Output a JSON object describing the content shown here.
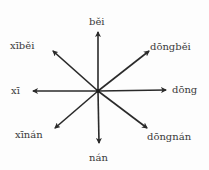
{
  "diagram": {
    "title": "",
    "center": {
      "x": 98,
      "y": 91
    },
    "directions": [
      {
        "key": "north",
        "label": "běi",
        "tip": {
          "x": 98,
          "y": 32
        },
        "label_pos": {
          "x": 89,
          "y": 17
        }
      },
      {
        "key": "northwest",
        "label": "xīběi",
        "tip": {
          "x": 53,
          "y": 51
        },
        "label_pos": {
          "x": 10,
          "y": 41
        }
      },
      {
        "key": "northeast",
        "label": "dōngběi",
        "tip": {
          "x": 149,
          "y": 51
        },
        "label_pos": {
          "x": 150,
          "y": 42
        }
      },
      {
        "key": "west",
        "label": "xī",
        "tip": {
          "x": 33,
          "y": 91
        },
        "label_pos": {
          "x": 11,
          "y": 86
        }
      },
      {
        "key": "east",
        "label": "dōng",
        "tip": {
          "x": 166,
          "y": 90
        },
        "label_pos": {
          "x": 172,
          "y": 85
        }
      },
      {
        "key": "southwest",
        "label": "xīnán",
        "tip": {
          "x": 55,
          "y": 128
        },
        "label_pos": {
          "x": 15,
          "y": 130
        }
      },
      {
        "key": "southeast",
        "label": "dōngnán",
        "tip": {
          "x": 147,
          "y": 128
        },
        "label_pos": {
          "x": 147,
          "y": 132
        }
      },
      {
        "key": "south",
        "label": "nán",
        "tip": {
          "x": 99,
          "y": 143
        },
        "label_pos": {
          "x": 89,
          "y": 153
        }
      }
    ],
    "colors": {
      "arrow": "#2a2a2a",
      "text": "#3a3a3a",
      "background": "#fdfdfd"
    }
  }
}
